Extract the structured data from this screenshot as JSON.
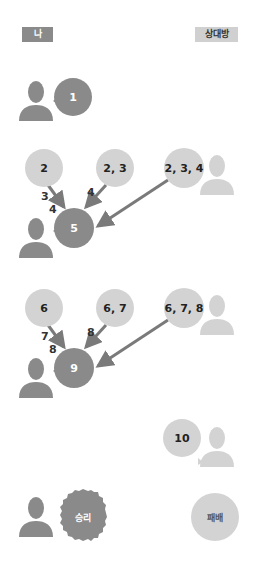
{
  "labels": {
    "me": "나",
    "opponent": "상대방"
  },
  "colors": {
    "my_turn": "#8a8a8a",
    "opponent_turn": "#d3d3d3",
    "arrow": "#7a7a7a"
  },
  "row1": {
    "me_bubble": "1"
  },
  "row2": {
    "options": [
      "2",
      "2, 3",
      "2, 3, 4"
    ],
    "arrow_labels": [
      "3",
      "4",
      "4"
    ],
    "me_bubble": "5"
  },
  "row3": {
    "options": [
      "6",
      "6, 7",
      "6, 7, 8"
    ],
    "arrow_labels": [
      "7",
      "8",
      "8"
    ],
    "me_bubble": "9"
  },
  "row4": {
    "opponent_bubble": "10"
  },
  "result": {
    "win": "승리",
    "lose": "패배"
  }
}
